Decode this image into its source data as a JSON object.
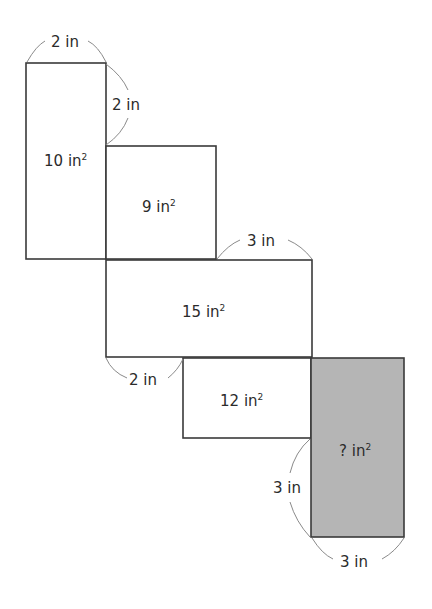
{
  "diagram": {
    "type": "net of rectangles (area puzzle)",
    "colors": {
      "stroke": "#3a3a3a",
      "shaded_fill": "#b5b5b5",
      "arc": "#8a8a8a",
      "text": "#2b2b2b"
    },
    "rectangles": [
      {
        "id": "r1",
        "area": "10",
        "unit": "in",
        "shaded": false
      },
      {
        "id": "r2",
        "area": "9",
        "unit": "in",
        "shaded": false
      },
      {
        "id": "r3",
        "area": "15",
        "unit": "in",
        "shaded": false
      },
      {
        "id": "r4",
        "area": "12",
        "unit": "in",
        "shaded": false
      },
      {
        "id": "r5",
        "area": "?",
        "unit": "in",
        "shaded": true
      }
    ],
    "dimensions": [
      {
        "id": "d1",
        "label": "2 in",
        "of": "r1 top width"
      },
      {
        "id": "d2",
        "label": "2 in",
        "of": "r1 right edge segment"
      },
      {
        "id": "d3",
        "label": "3 in",
        "of": "r3 top right segment"
      },
      {
        "id": "d4",
        "label": "2 in",
        "of": "r3 bottom left segment"
      },
      {
        "id": "d5",
        "label": "3 in",
        "of": "r5 left edge segment"
      },
      {
        "id": "d6",
        "label": "3 in",
        "of": "r5 bottom width"
      }
    ],
    "square_symbol": "2"
  }
}
